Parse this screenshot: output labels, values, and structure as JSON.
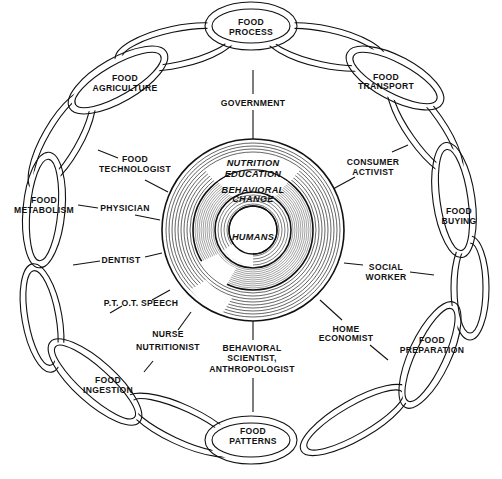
{
  "center": {
    "core": "HUMANS",
    "middle_ring": [
      "BEHAVIORAL",
      "CHANGE"
    ],
    "outer_ring": [
      "NUTRITION",
      "EDUCATION"
    ]
  },
  "chain_links": [
    {
      "id": "food-process",
      "lines": [
        "FOOD",
        "PROCESS"
      ]
    },
    {
      "id": "food-transport",
      "lines": [
        "FOOD",
        "TRANSPORT"
      ]
    },
    {
      "id": "food-buying",
      "lines": [
        "FOOD",
        "BUYING"
      ]
    },
    {
      "id": "food-preparation",
      "lines": [
        "FOOD",
        "PREPARATION"
      ]
    },
    {
      "id": "food-patterns",
      "lines": [
        "FOOD",
        "PATTERNS"
      ]
    },
    {
      "id": "food-ingestion",
      "lines": [
        "FOOD",
        "INGESTION"
      ]
    },
    {
      "id": "food-metabolism",
      "lines": [
        "FOOD",
        "METABOLISM"
      ]
    },
    {
      "id": "food-agriculture",
      "lines": [
        "FOOD",
        "AGRICULTURE"
      ]
    }
  ],
  "professions": [
    {
      "id": "government",
      "lines": [
        "GOVERNMENT"
      ]
    },
    {
      "id": "consumer-activist",
      "lines": [
        "CONSUMER",
        "ACTIVIST"
      ]
    },
    {
      "id": "social-worker",
      "lines": [
        "SOCIAL",
        "WORKER"
      ]
    },
    {
      "id": "home-economist",
      "lines": [
        "HOME",
        "ECONOMIST"
      ]
    },
    {
      "id": "behavioral-scientist",
      "lines": [
        "BEHAVIORAL",
        "SCIENTIST,",
        "ANTHROPOLOGIST"
      ]
    },
    {
      "id": "nurse-nutritionist",
      "lines": [
        "NURSE",
        "NUTRITIONIST"
      ]
    },
    {
      "id": "pt-ot-speech",
      "lines": [
        "P.T. O.T. SPEECH"
      ]
    },
    {
      "id": "dentist",
      "lines": [
        "DENTIST"
      ]
    },
    {
      "id": "physician",
      "lines": [
        "PHYSICIAN"
      ]
    },
    {
      "id": "food-technologist",
      "lines": [
        "FOOD",
        "TECHNOLOGIST"
      ]
    }
  ],
  "colors": {
    "ink": "#111111",
    "paper": "#ffffff",
    "hatch": "#555555"
  }
}
